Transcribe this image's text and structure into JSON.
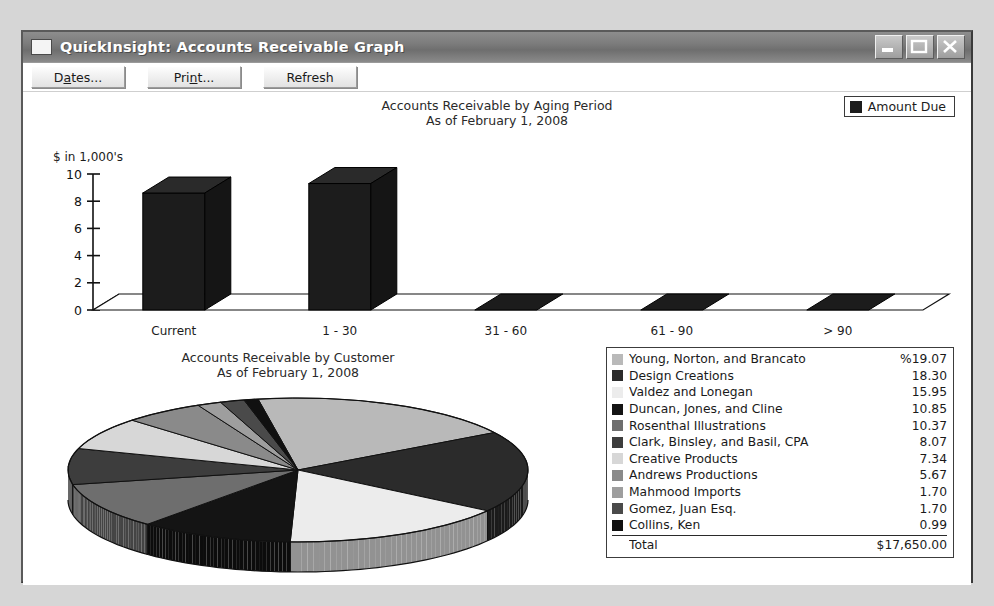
{
  "window": {
    "title": "QuickInsight: Accounts Receivable Graph",
    "icon": "window-icon",
    "buttons": {
      "minimize": "minimize-icon",
      "maximize": "maximize-icon",
      "close": "close-icon"
    }
  },
  "toolbar": {
    "dates": {
      "pre": "D",
      "mn": "a",
      "post": "tes..."
    },
    "print": {
      "pre": "Pri",
      "mn": "n",
      "post": "t..."
    },
    "refresh": {
      "pre": "Refresh",
      "mn": "",
      "post": ""
    }
  },
  "bar_section": {
    "title_line1": "Accounts Receivable by Aging Period",
    "title_line2": "As of February 1, 2008",
    "legend_label": "Amount Due",
    "legend_color": "#1c1c1c",
    "axis_unit": "$ in 1,000's"
  },
  "pie_section": {
    "title_line1": "Accounts Receivable by Customer",
    "title_line2": "As of February 1, 2008"
  },
  "detail_legend": {
    "total_label": "Total",
    "total_value": "$17,650.00",
    "rows": [
      {
        "name": "Young, Norton, and Brancato",
        "value": "%19.07",
        "color": "#b9b9b9"
      },
      {
        "name": "Design Creations",
        "value": "18.30",
        "color": "#2b2b2b"
      },
      {
        "name": "Valdez and Lonegan",
        "value": "15.95",
        "color": "#ececec"
      },
      {
        "name": "Duncan, Jones, and Cline",
        "value": "10.85",
        "color": "#141414"
      },
      {
        "name": "Rosenthal Illustrations",
        "value": "10.37",
        "color": "#6e6e6e"
      },
      {
        "name": "Clark, Binsley, and Basil, CPA",
        "value": "8.07",
        "color": "#3d3d3d"
      },
      {
        "name": "Creative Products",
        "value": "7.34",
        "color": "#d7d7d7"
      },
      {
        "name": "Andrews Productions",
        "value": "5.67",
        "color": "#8a8a8a"
      },
      {
        "name": "Mahmood Imports",
        "value": "1.70",
        "color": "#9e9e9e"
      },
      {
        "name": "Gomez, Juan Esq.",
        "value": "1.70",
        "color": "#4a4a4a"
      },
      {
        "name": "Collins, Ken",
        "value": "0.99",
        "color": "#101010"
      }
    ]
  },
  "chart_data": [
    {
      "type": "bar",
      "title": "Accounts Receivable by Aging Period",
      "subtitle": "As of February 1, 2008",
      "xlabel": "",
      "ylabel": "$ in 1,000's",
      "ylim": [
        0,
        10
      ],
      "yticks": [
        "0",
        "2",
        "4",
        "6",
        "8",
        "10"
      ],
      "grid": false,
      "legend": [
        "Amount Due"
      ],
      "legend_position": "top-right",
      "categories": [
        "Current",
        "1 - 30",
        "31 - 60",
        "61 - 90",
        "> 90"
      ],
      "series": [
        {
          "name": "Amount Due",
          "values": [
            8.6,
            9.3,
            0,
            0,
            0
          ]
        }
      ]
    },
    {
      "type": "pie",
      "title": "Accounts Receivable by Customer",
      "subtitle": "As of February 1, 2008",
      "legend_position": "right",
      "total": "$17,650.00",
      "labels": [
        "Young, Norton, and Brancato",
        "Design Creations",
        "Valdez and Lonegan",
        "Duncan, Jones, and Cline",
        "Rosenthal Illustrations",
        "Clark, Binsley, and Basil, CPA",
        "Creative Products",
        "Andrews Productions",
        "Mahmood Imports",
        "Gomez, Juan Esq.",
        "Collins, Ken"
      ],
      "values": [
        19.07,
        18.3,
        15.95,
        10.85,
        10.37,
        8.07,
        7.34,
        5.67,
        1.7,
        1.7,
        0.99
      ],
      "unit": "%",
      "colors": [
        "#b9b9b9",
        "#2b2b2b",
        "#ececec",
        "#141414",
        "#6e6e6e",
        "#3d3d3d",
        "#d7d7d7",
        "#8a8a8a",
        "#9e9e9e",
        "#4a4a4a",
        "#101010"
      ]
    }
  ]
}
